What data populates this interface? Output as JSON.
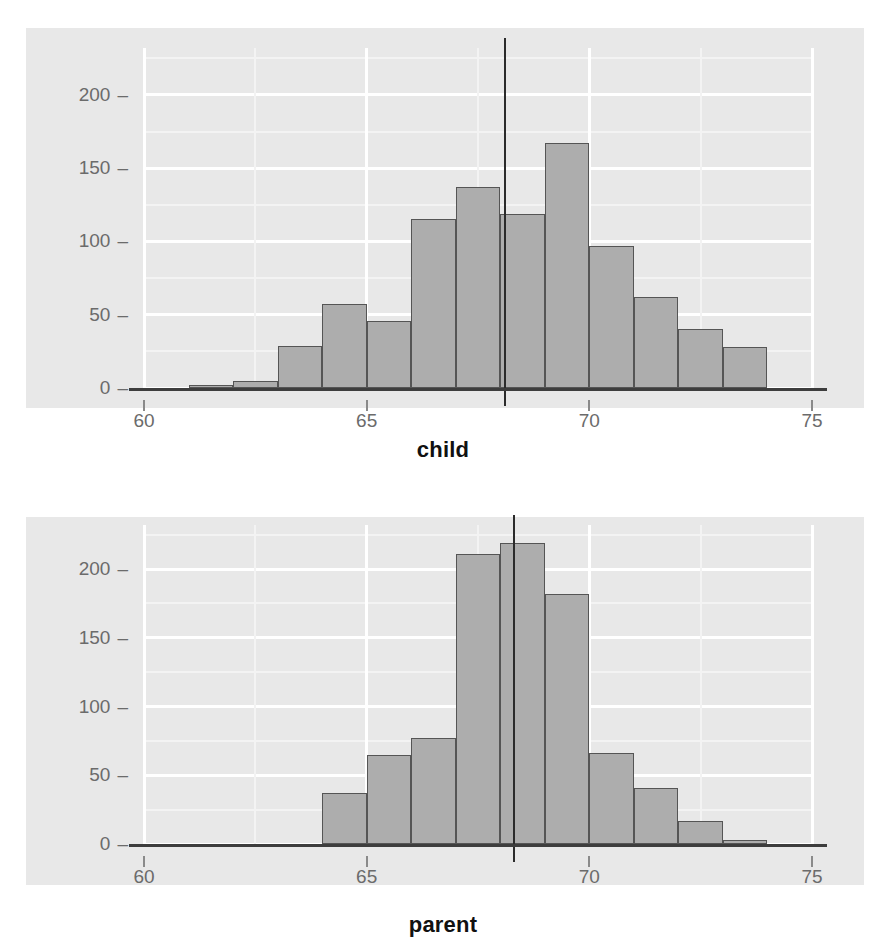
{
  "chart_data": [
    {
      "type": "bar",
      "id": "child-histogram",
      "title": "",
      "xlabel": "child",
      "ylabel": "",
      "xlim": [
        60,
        75
      ],
      "ylim": [
        0,
        232
      ],
      "grid": true,
      "legend": false,
      "bin_width": 1,
      "x_ticks": [
        60,
        65,
        70,
        75
      ],
      "x_tick_labels": [
        "60",
        "65",
        "70",
        "75"
      ],
      "y_ticks": [
        0,
        50,
        100,
        150,
        200
      ],
      "y_tick_labels": [
        "0",
        "50",
        "100",
        "150",
        "200"
      ],
      "bin_starts": [
        61,
        62,
        63,
        64,
        65,
        66,
        67,
        68,
        69,
        70,
        71,
        72,
        73
      ],
      "categories": [
        "61-62",
        "62-63",
        "63-64",
        "64-65",
        "65-66",
        "66-67",
        "67-68",
        "68-69",
        "69-70",
        "70-71",
        "71-72",
        "72-73",
        "73-74"
      ],
      "values": [
        2,
        5,
        29,
        57,
        46,
        115,
        137,
        119,
        167,
        97,
        62,
        40,
        28
      ],
      "annotations": [
        {
          "type": "vline",
          "x": 68.1,
          "label": "mean child height"
        }
      ]
    },
    {
      "type": "bar",
      "id": "parent-histogram",
      "title": "",
      "xlabel": "parent",
      "ylabel": "",
      "xlim": [
        60,
        75
      ],
      "ylim": [
        0,
        232
      ],
      "grid": true,
      "legend": false,
      "bin_width": 1,
      "x_ticks": [
        60,
        65,
        70,
        75
      ],
      "x_tick_labels": [
        "60",
        "65",
        "70",
        "75"
      ],
      "y_ticks": [
        0,
        50,
        100,
        150,
        200
      ],
      "y_tick_labels": [
        "0",
        "50",
        "100",
        "150",
        "200"
      ],
      "bin_starts": [
        64,
        65,
        66,
        67,
        68,
        69,
        70,
        71,
        72,
        73
      ],
      "categories": [
        "64-65",
        "65-66",
        "66-67",
        "67-68",
        "68-69",
        "69-70",
        "70-71",
        "71-72",
        "72-73",
        "73-74"
      ],
      "values": [
        37,
        65,
        77,
        211,
        219,
        182,
        66,
        41,
        17,
        3
      ],
      "annotations": [
        {
          "type": "vline",
          "x": 68.3,
          "label": "mean parent height"
        }
      ]
    }
  ],
  "style": {
    "panel_background": "#e8e8e8",
    "bar_fill": "#adadad",
    "bar_border": "#555555",
    "grid_major": "#ffffff",
    "grid_minor": "#f3f3f3",
    "axis_line": "#3d3d3d",
    "reference_line": "#2b2b2b",
    "tick_label": "#6b6b6b",
    "axis_title": "#111111"
  }
}
